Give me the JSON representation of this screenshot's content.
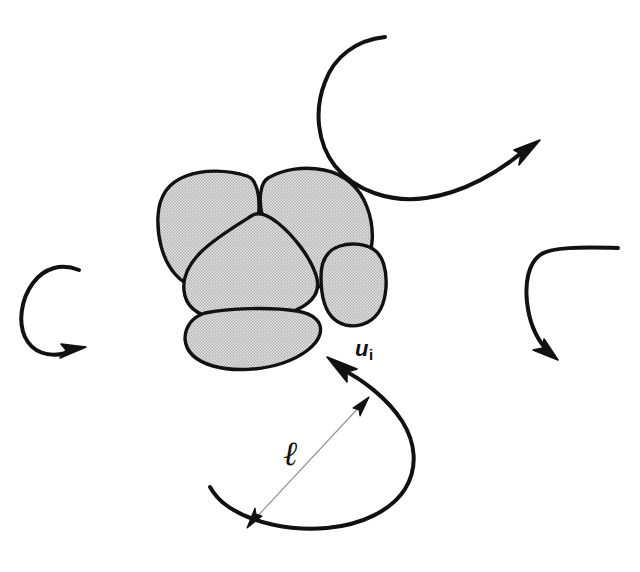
{
  "figure": {
    "type": "scientific-diagram",
    "background_color": "#ffffff",
    "width": 640,
    "height": 572
  },
  "labels": {
    "velocity": {
      "symbol": "u",
      "subscript": "i",
      "full": "u_i",
      "meaning": "eddy velocity"
    },
    "length_scale": {
      "symbol": "ℓ",
      "full": "ℓ",
      "meaning": "eddy length scale"
    }
  },
  "style": {
    "stroke_color": "#111111",
    "blob_fill": "#c9c9c9",
    "blob_stroke": "#111111",
    "dimension_line_color": "#8d8d8d",
    "eddy_stroke_width": 4,
    "blob_stroke_width": 3.2,
    "dimension_stroke_width": 1
  },
  "elements": {
    "cluster": {
      "name": "particle-cluster",
      "blob_count": 5,
      "blobs": [
        {
          "id": "blob-upper-left",
          "label": "upper left floc"
        },
        {
          "id": "blob-upper-right",
          "label": "upper right floc"
        },
        {
          "id": "blob-center",
          "label": "central floc"
        },
        {
          "id": "blob-right-small",
          "label": "small right floc"
        },
        {
          "id": "blob-bottom",
          "label": "bottom elongated floc"
        }
      ]
    },
    "eddies": [
      {
        "id": "eddy-top-right",
        "label": "top right eddy",
        "arrow_direction": "up-right"
      },
      {
        "id": "eddy-left",
        "label": "left eddy",
        "arrow_direction": "right"
      },
      {
        "id": "eddy-right",
        "label": "right eddy",
        "arrow_direction": "down-right"
      },
      {
        "id": "eddy-bottom",
        "label": "bottom eddy",
        "arrow_direction": "up-left"
      }
    ],
    "dimension": {
      "id": "length-scale-dimension",
      "label": "double headed arrow spanning the bottom eddy diameter",
      "from": [
        368,
        398
      ],
      "to": [
        248,
        527
      ]
    }
  }
}
